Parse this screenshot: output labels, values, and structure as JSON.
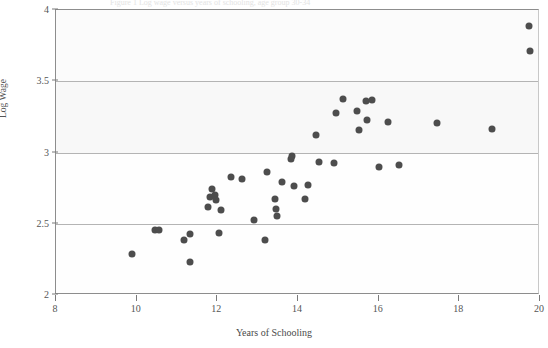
{
  "figure": {
    "ghost_title": "Figure 1  Log wage versus years of schooling, age group 30-34",
    "ghost_body": "scanned page bleed-through text fragment not legible"
  },
  "chart_data": {
    "type": "scatter",
    "title": "",
    "xlabel": "Years of Schooling",
    "ylabel": "Log Wage",
    "xlim": [
      8,
      20
    ],
    "ylim": [
      2,
      4
    ],
    "xticks": [
      8,
      10,
      12,
      14,
      16,
      18,
      20
    ],
    "yticks": [
      2,
      2.5,
      3,
      3.5,
      4
    ],
    "xtick_labels": [
      "8",
      "10",
      "12",
      "14",
      "16",
      "18",
      "20"
    ],
    "ytick_labels": [
      "2",
      "2.5",
      "3",
      "3.5",
      "4"
    ],
    "grid": "horizontal",
    "legend": "none",
    "marker_color": "#4d4d4d",
    "marker_size_px": 7,
    "series": [
      {
        "name": "observations",
        "points": [
          [
            9.89,
            2.285
          ],
          [
            10.46,
            2.455
          ],
          [
            10.56,
            2.455
          ],
          [
            11.18,
            2.385
          ],
          [
            11.32,
            2.425
          ],
          [
            11.33,
            2.235
          ],
          [
            11.77,
            2.615
          ],
          [
            11.83,
            2.69
          ],
          [
            11.88,
            2.745
          ],
          [
            11.95,
            2.7
          ],
          [
            11.97,
            2.665
          ],
          [
            12.05,
            2.435
          ],
          [
            12.09,
            2.595
          ],
          [
            12.34,
            2.825
          ],
          [
            12.6,
            2.815
          ],
          [
            12.92,
            2.525
          ],
          [
            13.18,
            2.385
          ],
          [
            13.23,
            2.865
          ],
          [
            13.42,
            2.675
          ],
          [
            13.46,
            2.605
          ],
          [
            13.49,
            2.555
          ],
          [
            13.6,
            2.795
          ],
          [
            13.82,
            2.955
          ],
          [
            13.86,
            2.975
          ],
          [
            13.89,
            2.765
          ],
          [
            14.18,
            2.675
          ],
          [
            14.24,
            2.775
          ],
          [
            14.45,
            3.12
          ],
          [
            14.53,
            2.935
          ],
          [
            14.9,
            2.925
          ],
          [
            14.93,
            3.275
          ],
          [
            15.12,
            3.375
          ],
          [
            15.47,
            3.29
          ],
          [
            15.52,
            3.155
          ],
          [
            15.68,
            3.36
          ],
          [
            15.72,
            3.23
          ],
          [
            15.83,
            3.37
          ],
          [
            16.0,
            2.895
          ],
          [
            16.24,
            3.215
          ],
          [
            16.5,
            2.91
          ],
          [
            17.45,
            3.205
          ],
          [
            18.82,
            3.165
          ],
          [
            19.73,
            3.89
          ],
          [
            19.74,
            3.715
          ]
        ]
      }
    ]
  }
}
